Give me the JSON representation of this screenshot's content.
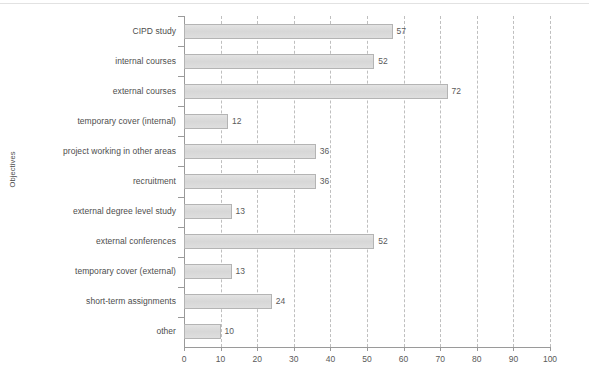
{
  "chart_data": {
    "type": "bar",
    "orientation": "horizontal",
    "title": "",
    "xlabel": "",
    "ylabel": "Objectives",
    "xlim": [
      0,
      100
    ],
    "xticks": [
      "0",
      "10",
      "20",
      "30",
      "40",
      "50",
      "60",
      "70",
      "80",
      "90",
      "100"
    ],
    "grid": "vertical-dashed",
    "legend": "none",
    "categories": [
      "CIPD study",
      "internal courses",
      "external courses",
      "temporary cover (internal)",
      "project working in other areas",
      "recruitment",
      "external degree level study",
      "external conferences",
      "temporary cover (external)",
      "short-term assignments",
      "other"
    ],
    "values": [
      57,
      52,
      72,
      12,
      36,
      36,
      13,
      52,
      13,
      24,
      10
    ],
    "value_labels": [
      "57",
      "52",
      "72",
      "12",
      "36",
      "36",
      "13",
      "52",
      "13",
      "24",
      "10"
    ],
    "bar_fill_color": "#dcdcdc",
    "bar_border_color": "#b4b4b4",
    "gridline_color": "#bfbfbf",
    "axis_color": "#9a9a9a",
    "text_color": "#4d4d4d",
    "background_color": "#ffffff"
  }
}
